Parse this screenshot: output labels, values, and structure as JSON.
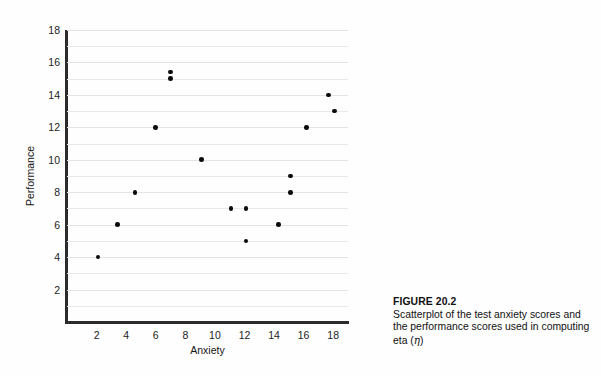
{
  "figure": {
    "label": "FIGURE 20.2",
    "caption": "Scatterplot of the test anxiety scores and the performance scores used in computing eta (",
    "caption_eta": "η",
    "caption_tail": ")"
  },
  "chart_data": {
    "type": "scatter",
    "title": "",
    "xlabel": "Anxiety",
    "ylabel": "Performance",
    "xlim": [
      0,
      19
    ],
    "ylim": [
      0,
      18
    ],
    "xticks": [
      2,
      4,
      6,
      8,
      10,
      12,
      14,
      16,
      18
    ],
    "xtick_labels": [
      "2",
      "4",
      "6",
      "8",
      "10",
      "12",
      "14",
      "16",
      "18"
    ],
    "yticks": [
      2,
      4,
      6,
      8,
      10,
      12,
      14,
      16,
      18
    ],
    "ytick_labels": [
      "2",
      "4",
      "6",
      "8",
      "10",
      "12",
      "14",
      "16",
      "18"
    ],
    "gridlines_y": [
      1,
      2,
      3,
      4,
      5,
      6,
      7,
      8,
      9,
      10,
      11,
      12,
      13,
      14,
      15,
      16,
      17,
      18
    ],
    "grid": true,
    "grid_axis": "y",
    "legend": "none",
    "marker": "filled-circle",
    "marker_color": "#0b0b0b",
    "points": [
      {
        "x": 2.1,
        "y": 4
      },
      {
        "x": 3.4,
        "y": 6
      },
      {
        "x": 4.6,
        "y": 8
      },
      {
        "x": 6.0,
        "y": 12
      },
      {
        "x": 7.0,
        "y": 15.4
      },
      {
        "x": 7.0,
        "y": 15.0
      },
      {
        "x": 9.1,
        "y": 10
      },
      {
        "x": 11.1,
        "y": 7
      },
      {
        "x": 12.1,
        "y": 7
      },
      {
        "x": 12.1,
        "y": 5
      },
      {
        "x": 14.3,
        "y": 6
      },
      {
        "x": 15.1,
        "y": 9
      },
      {
        "x": 15.1,
        "y": 8
      },
      {
        "x": 16.2,
        "y": 12
      },
      {
        "x": 17.7,
        "y": 14
      },
      {
        "x": 18.1,
        "y": 13
      }
    ]
  }
}
